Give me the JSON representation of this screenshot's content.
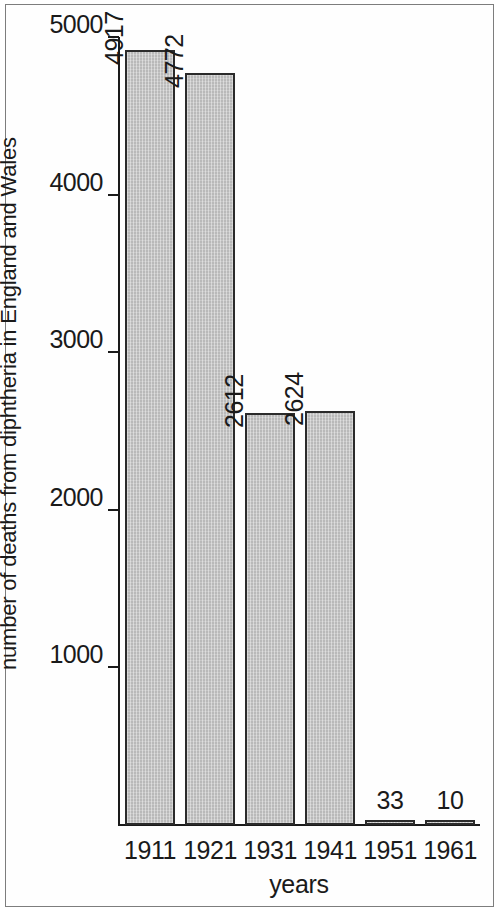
{
  "chart_data": {
    "type": "bar",
    "title": "",
    "subtitle": "",
    "xlabel": "years",
    "ylabel": "number of deaths from diphtheria in England and Wales",
    "categories": [
      "1911",
      "1921",
      "1931",
      "1941",
      "1951",
      "1961"
    ],
    "values": [
      4917,
      4772,
      2612,
      2624,
      33,
      10
    ],
    "value_labels": [
      "4917",
      "4772",
      "2612",
      "2624",
      "33",
      "10"
    ],
    "ylim": [
      0,
      5000
    ],
    "ytick_labels": [
      "5000",
      "4000",
      "3000",
      "2000",
      "1000"
    ],
    "ytick_values": [
      5000,
      4000,
      3000,
      2000,
      1000
    ],
    "grid": false,
    "legend": null,
    "legend_position": "none",
    "bar_fill_color": "#b9b9b9",
    "bar_border_color": "#2b2b2b",
    "axis_color": "#1a1a1a",
    "background_color": "#ffffff"
  }
}
